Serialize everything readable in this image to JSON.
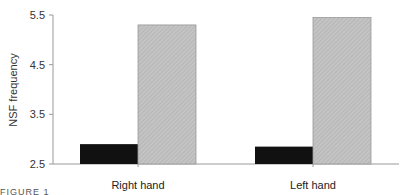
{
  "chart_data": {
    "type": "bar",
    "title": "",
    "xlabel": "",
    "ylabel": "NSF frequency",
    "ylim": [
      2.5,
      5.5
    ],
    "yticks": [
      2.5,
      3.5,
      4.5,
      5.5
    ],
    "ytick_labels": [
      "2.5",
      "3.5",
      "4.5",
      "5.5"
    ],
    "grid": false,
    "legend": null,
    "categories": [
      "Right hand",
      "Left hand"
    ],
    "series": [
      {
        "name": "Condition 1 (solid black)",
        "color": "#111111",
        "pattern": "solid",
        "values": [
          2.9,
          2.85
        ]
      },
      {
        "name": "Condition 2 (gray hatched)",
        "color": "#bdbdbd",
        "pattern": "hatched",
        "values": [
          5.3,
          5.45
        ]
      }
    ]
  },
  "caption": "FIGURE 1"
}
